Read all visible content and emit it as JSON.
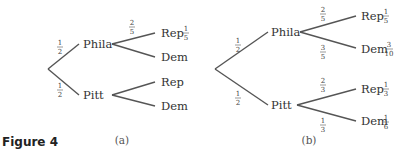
{
  "figure": {
    "label": "Figure 4",
    "diagrams": [
      {
        "caption": "(a)",
        "root_edges": [
          {
            "to": "Phila",
            "prob": {
              "num": "1",
              "den": "2"
            }
          },
          {
            "to": "Pitt",
            "prob": {
              "num": "1",
              "den": "2"
            }
          }
        ],
        "nodes": [
          {
            "label": "Phila",
            "children": [
              {
                "label": "Rep",
                "edge_prob": {
                  "num": "2",
                  "den": "5"
                },
                "joint": {
                  "num": "1",
                  "den": "5"
                }
              },
              {
                "label": "Dem",
                "edge_prob": null,
                "joint": null
              }
            ]
          },
          {
            "label": "Pitt",
            "children": [
              {
                "label": "Rep",
                "edge_prob": null,
                "joint": null
              },
              {
                "label": "Dem",
                "edge_prob": null,
                "joint": null
              }
            ]
          }
        ]
      },
      {
        "caption": "(b)",
        "root_edges": [
          {
            "to": "Phila",
            "prob": {
              "num": "1",
              "den": "2"
            }
          },
          {
            "to": "Pitt",
            "prob": {
              "num": "1",
              "den": "2"
            }
          }
        ],
        "nodes": [
          {
            "label": "Phila",
            "children": [
              {
                "label": "Rep",
                "edge_prob": {
                  "num": "2",
                  "den": "5"
                },
                "joint": {
                  "num": "1",
                  "den": "5"
                }
              },
              {
                "label": "Dem",
                "edge_prob": {
                  "num": "3",
                  "den": "5"
                },
                "joint": {
                  "num": "3",
                  "den": "10"
                }
              }
            ]
          },
          {
            "label": "Pitt",
            "children": [
              {
                "label": "Rep",
                "edge_prob": {
                  "num": "2",
                  "den": "3"
                },
                "joint": {
                  "num": "1",
                  "den": "3"
                }
              },
              {
                "label": "Dem",
                "edge_prob": {
                  "num": "1",
                  "den": "3"
                },
                "joint": {
                  "num": "1",
                  "den": "6"
                }
              }
            ]
          }
        ]
      }
    ]
  },
  "colors": {
    "line": "#555555",
    "text": "#333333",
    "background": "#ffffff"
  }
}
